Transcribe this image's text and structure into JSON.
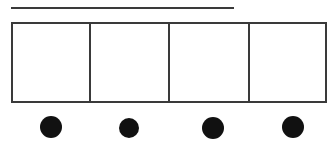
{
  "figure": {
    "canvas": {
      "width": 327,
      "height": 145,
      "background": "#ffffff"
    },
    "stroke_color": "#3a3a3a",
    "fill_color": "#ffffff",
    "dot_color": "#111111",
    "rule": {
      "name": "top-horizontal-rule",
      "x1": 11,
      "y1": 8,
      "x2": 234,
      "y2": 8,
      "thickness": 2
    },
    "bar": {
      "name": "partitioned-bar",
      "x": 11,
      "y": 22,
      "width": 316,
      "height": 81,
      "thickness": 2,
      "cell_count": 4,
      "clipped_right": true,
      "dividers": [
        {
          "label": "divider-1",
          "x": 90
        },
        {
          "label": "divider-2",
          "x": 169
        },
        {
          "label": "divider-3",
          "x": 249
        }
      ],
      "cells": [
        {
          "label": "cell-1",
          "x": 11,
          "width": 79
        },
        {
          "label": "cell-2",
          "x": 90,
          "width": 79
        },
        {
          "label": "cell-3",
          "x": 169,
          "width": 80
        },
        {
          "label": "cell-4",
          "x": 249,
          "width": 78
        }
      ]
    },
    "dots": {
      "name": "dot-row",
      "count": 4,
      "items": [
        {
          "label": "dot-1",
          "cx": 51,
          "cy": 127,
          "r": 11
        },
        {
          "label": "dot-2",
          "cx": 129,
          "cy": 128,
          "r": 10
        },
        {
          "label": "dot-3",
          "cx": 213,
          "cy": 128,
          "r": 11
        },
        {
          "label": "dot-4",
          "cx": 293,
          "cy": 127,
          "r": 11
        }
      ]
    }
  }
}
